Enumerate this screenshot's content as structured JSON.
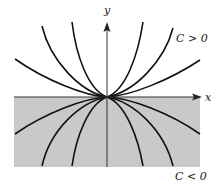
{
  "diagram": {
    "type": "family-of-curves",
    "axes": {
      "x_label": "x",
      "y_label": "y"
    },
    "regions": {
      "upper_label": "C > 0",
      "lower_label": "C < 0",
      "lower_fill": "#c9c9c9"
    },
    "colors": {
      "curve": "#111111",
      "axis": "#333333",
      "background": "#ffffff"
    },
    "upper_curves": [
      {
        "name": "upper-curve-1",
        "d": "M107,97 C85,96 45,80 15,59"
      },
      {
        "name": "upper-curve-2",
        "d": "M107,97 C80,92 50,60 42,26"
      },
      {
        "name": "upper-curve-3",
        "d": "M107,97 C88,90 76,55 72,22"
      },
      {
        "name": "upper-curve-4",
        "d": "M107,97 C126,90 138,55 143,22"
      },
      {
        "name": "upper-curve-5",
        "d": "M107,97 C134,92 164,62 173,28"
      },
      {
        "name": "upper-curve-6",
        "d": "M107,97 C130,96 170,80 200,60"
      }
    ],
    "lower_curves": [
      {
        "name": "lower-curve-1",
        "d": "M107,97 C85,98 45,113 15,134"
      },
      {
        "name": "lower-curve-2",
        "d": "M107,97 C80,102 50,130 42,166"
      },
      {
        "name": "lower-curve-3",
        "d": "M107,97 C88,104 76,138 72,166"
      },
      {
        "name": "lower-curve-4",
        "d": "M107,97 C126,104 138,138 143,166"
      },
      {
        "name": "lower-curve-5",
        "d": "M107,97 C134,102 164,130 173,166"
      },
      {
        "name": "lower-curve-6",
        "d": "M107,97 C130,98 170,113 200,134"
      }
    ]
  }
}
